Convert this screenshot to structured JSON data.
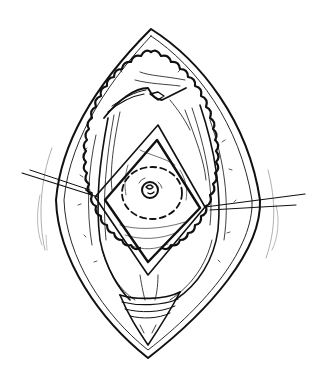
{
  "figure": {
    "description": "Surgical line illustration of an elliptical (lens-shaped) incision with retracted skin edges, exposed muscle fibers, a diamond-shaped fascial opening, a dashed circular marking and a central stoma/umbilical structure; two suture lines cross the wound from left and right.",
    "style": "black-and-white pen illustration",
    "colors": {
      "ink": "#111111",
      "background": "#ffffff",
      "faint": "#9a9a9a"
    },
    "elements": [
      {
        "name": "outer-skin-incision",
        "shape": "lens"
      },
      {
        "name": "scalloped-subcutaneous-edge",
        "shape": "scalloped lens"
      },
      {
        "name": "muscle-fibers",
        "shape": "striated strands"
      },
      {
        "name": "top-tissue-flap",
        "shape": "folded flap"
      },
      {
        "name": "diamond-fascial-opening",
        "shape": "diamond"
      },
      {
        "name": "dashed-circle-marking",
        "shape": "dashed ellipse"
      },
      {
        "name": "central-stoma",
        "shape": "rosette"
      },
      {
        "name": "left-suture",
        "shape": "double line"
      },
      {
        "name": "right-suture",
        "shape": "double line"
      },
      {
        "name": "bottom-tissue-fold",
        "shape": "banded fold"
      }
    ]
  }
}
